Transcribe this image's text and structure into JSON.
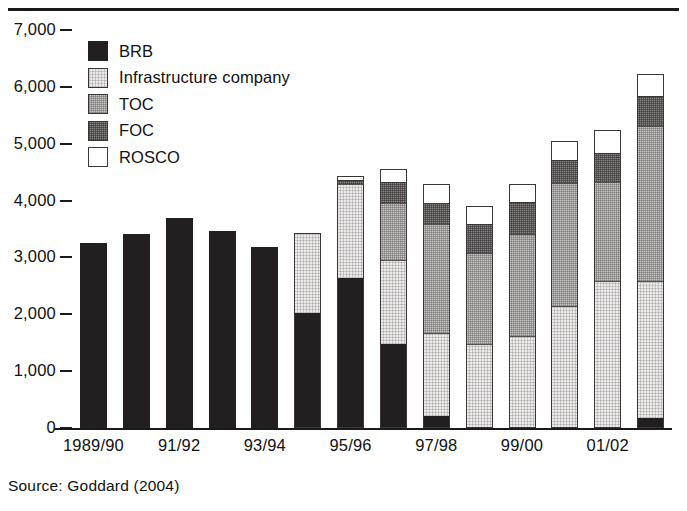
{
  "figure": {
    "source_note": "Source: Goddard (2004)"
  },
  "legend": {
    "items": [
      {
        "label": "BRB",
        "key": "brb",
        "color": "#231f20"
      },
      {
        "label": "Infrastructure company",
        "key": "infra",
        "color": "#eceaea"
      },
      {
        "label": "TOC",
        "key": "toc",
        "color": "#c9c7c6"
      },
      {
        "label": "FOC",
        "key": "foc",
        "color": "#8a8684"
      },
      {
        "label": "ROSCO",
        "key": "rosco",
        "color": "#ffffff"
      }
    ]
  },
  "chart_data": {
    "type": "bar",
    "stacked": true,
    "title": "",
    "subtitle": "",
    "xlabel": "",
    "ylabel": "",
    "grid": false,
    "legend_position": "top-left",
    "ylim": [
      0,
      7000
    ],
    "yticks": [
      0,
      1000,
      2000,
      3000,
      4000,
      5000,
      6000,
      7000
    ],
    "ytick_labels": [
      "0",
      "1,000",
      "2,000",
      "3,000",
      "4,000",
      "5,000",
      "6,000",
      "7,000"
    ],
    "categories": [
      "1989/90",
      "90/91",
      "91/92",
      "92/93",
      "93/94",
      "94/95",
      "95/96",
      "96/97",
      "97/98",
      "98/99",
      "99/00",
      "00/01",
      "01/02",
      "02/03"
    ],
    "xtick_labels_shown": [
      "1989/90",
      "91/92",
      "93/94",
      "95/96",
      "97/98",
      "99/00",
      "01/02"
    ],
    "xtick_label_indices": [
      0,
      2,
      4,
      6,
      8,
      10,
      12
    ],
    "series": [
      {
        "name": "BRB",
        "key": "brb",
        "color": "#231f20",
        "values": [
          3260,
          3420,
          3690,
          3470,
          3180,
          2030,
          2640,
          1470,
          210,
          0,
          0,
          0,
          0,
          180
        ]
      },
      {
        "name": "Infrastructure company",
        "key": "infra",
        "color": "#eceaea",
        "values": [
          0,
          0,
          0,
          0,
          0,
          1400,
          1650,
          1480,
          1460,
          1470,
          1610,
          2150,
          2580,
          2400
        ]
      },
      {
        "name": "TOC",
        "key": "toc",
        "color": "#c9c7c6",
        "values": [
          0,
          0,
          0,
          0,
          0,
          0,
          0,
          1000,
          1920,
          1600,
          1800,
          2160,
          1740,
          2740
        ]
      },
      {
        "name": "FOC",
        "key": "foc",
        "color": "#8a8684",
        "values": [
          0,
          0,
          0,
          0,
          0,
          0,
          70,
          370,
          370,
          510,
          560,
          400,
          510,
          520
        ]
      },
      {
        "name": "ROSCO",
        "key": "rosco",
        "color": "#ffffff",
        "values": [
          0,
          0,
          0,
          0,
          0,
          0,
          70,
          240,
          340,
          320,
          320,
          330,
          420,
          390
        ]
      }
    ],
    "totals": [
      3260,
      3420,
      3690,
      3470,
      3180,
      3430,
      4430,
      4560,
      4300,
      3900,
      4290,
      5040,
      5250,
      6230
    ]
  }
}
